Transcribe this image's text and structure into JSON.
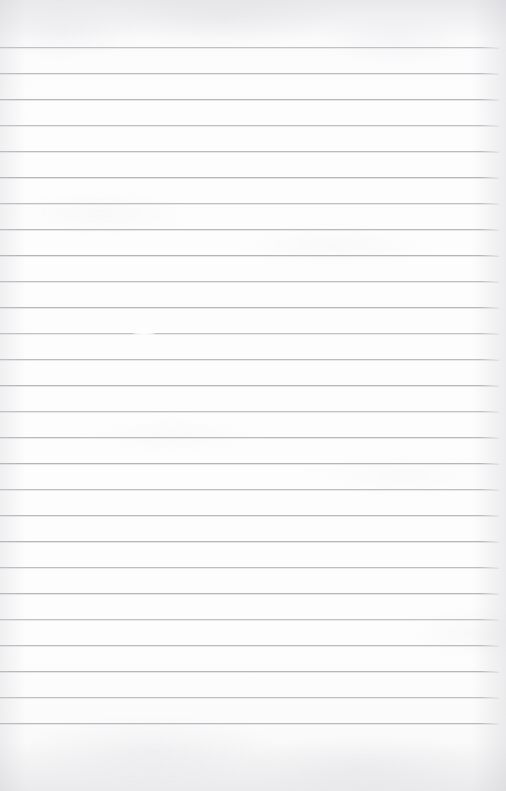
{
  "page": {
    "name": "ruled-notebook-page",
    "width": 506,
    "height": 791,
    "paper_color": "#fcfcfc",
    "rule_color": "#b4b4b9",
    "content_text": ""
  },
  "ruling": {
    "line_count": 27,
    "first_line_y": 47,
    "line_spacing": 26,
    "line_thickness": 1,
    "line_start_x": 0,
    "line_end_x": 499,
    "top_margin": 47,
    "bottom_margin": 60,
    "has_vertical_margin_rule": false,
    "line_y_positions": [
      47,
      73,
      99,
      125,
      151,
      177,
      203,
      229,
      255,
      281,
      307,
      333,
      359,
      385,
      411,
      437,
      463,
      489,
      515,
      541,
      567,
      593,
      619,
      645,
      671,
      697,
      723
    ]
  },
  "marks": [
    {
      "name": "faint-erasure-break",
      "x": 133,
      "y": 332,
      "width": 22,
      "height": 3,
      "note": "small pale gap interrupting a ruled line"
    }
  ],
  "lines_text": [
    "",
    "",
    "",
    "",
    "",
    "",
    "",
    "",
    "",
    "",
    "",
    "",
    "",
    "",
    "",
    "",
    "",
    "",
    "",
    "",
    "",
    "",
    "",
    "",
    "",
    "",
    ""
  ]
}
